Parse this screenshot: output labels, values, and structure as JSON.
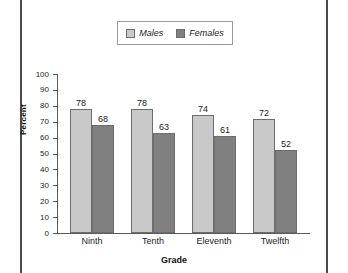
{
  "chart_data": {
    "type": "bar",
    "title": "",
    "xlabel": "Grade",
    "ylabel": "Percent",
    "categories": [
      "Ninth",
      "Tenth",
      "Eleventh",
      "Twelfth"
    ],
    "series": [
      {
        "name": "Males",
        "color": "#c9c9c9",
        "values": [
          78,
          78,
          74,
          72
        ]
      },
      {
        "name": "Females",
        "color": "#808080",
        "values": [
          68,
          63,
          61,
          52
        ]
      }
    ],
    "ylim": [
      0,
      100
    ],
    "yticks": [
      0,
      10,
      20,
      30,
      40,
      50,
      60,
      70,
      80,
      90,
      100
    ],
    "ytick_labels": [
      "0",
      "10",
      "20",
      "30",
      "40",
      "50",
      "60",
      "70",
      "80",
      "90",
      "100"
    ],
    "grid": false,
    "legend_position": "top-center",
    "bar_labels": true
  },
  "legend": {
    "entries": [
      {
        "label": "Males",
        "swatch_color": "#c9c9c9"
      },
      {
        "label": "Females",
        "swatch_color": "#808080"
      }
    ]
  },
  "axes": {
    "y_title": "Percent",
    "x_title": "Grade"
  }
}
